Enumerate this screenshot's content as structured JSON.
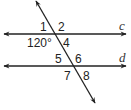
{
  "diagram": {
    "type": "parallel-lines-transversal",
    "lines": {
      "c": {
        "label": "c"
      },
      "d": {
        "label": "d"
      }
    },
    "angle_labels": {
      "a1": "1",
      "a2": "2",
      "a3": "120°",
      "a4": "4",
      "a5": "5",
      "a6": "6",
      "a7": "7",
      "a8": "8"
    },
    "colors": {
      "stroke": "#222222",
      "background": "#ffffff"
    }
  }
}
